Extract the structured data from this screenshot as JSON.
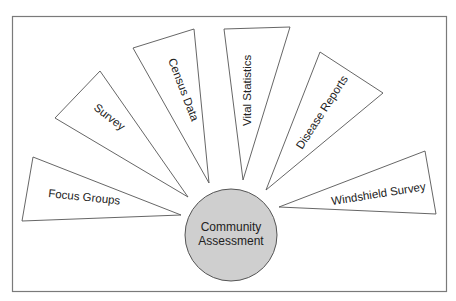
{
  "diagram": {
    "type": "hub-and-spoke",
    "hub": {
      "line1": "Community",
      "line2": "Assessment",
      "fill": "#cfcfcf"
    },
    "spokes": [
      {
        "label": "Focus Groups"
      },
      {
        "label": "Survey"
      },
      {
        "label": "Census Data"
      },
      {
        "label": "Vital Statistics"
      },
      {
        "label": "Disease Reports"
      },
      {
        "label": "Windshield Survey"
      }
    ]
  }
}
